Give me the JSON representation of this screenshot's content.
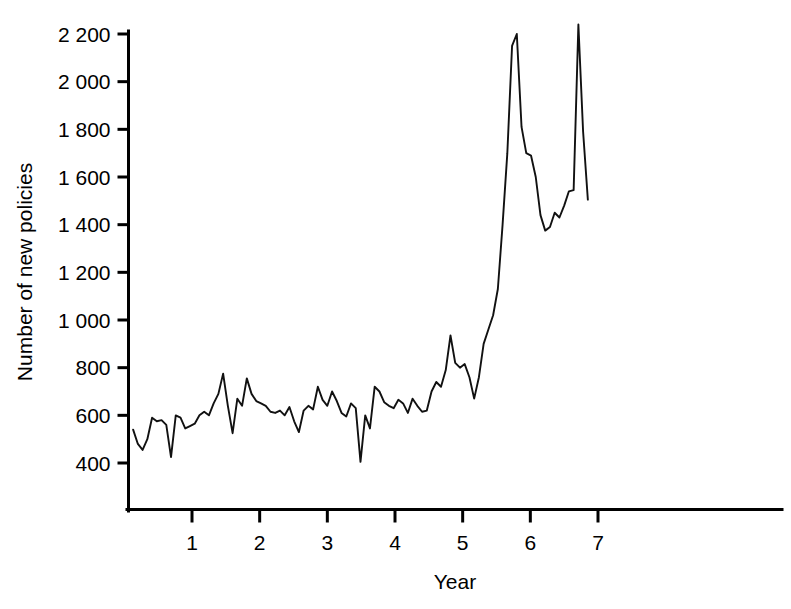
{
  "chart_data": {
    "type": "line",
    "title": "",
    "xlabel": "Year",
    "ylabel": "Number of new policies",
    "xlim": [
      0,
      7.15
    ],
    "ylim": [
      330,
      2300
    ],
    "grid": false,
    "legend": "none",
    "y_ticks": [
      400,
      600,
      800,
      1000,
      1200,
      1400,
      1600,
      1800,
      2000,
      2200
    ],
    "y_tick_labels": [
      "400",
      "600",
      "800",
      "1 000",
      "1 200",
      "1 400",
      "1 600",
      "1 800",
      "2 000",
      "2 200"
    ],
    "x_ticks": [
      1,
      2,
      3,
      4,
      5,
      6,
      7
    ],
    "x_tick_labels": [
      "1",
      "2",
      "3",
      "4",
      "5",
      "6",
      "7"
    ],
    "series": [
      {
        "name": "Number of new policies",
        "color": "#111111",
        "x": [
          0.13,
          0.2,
          0.27,
          0.34,
          0.41,
          0.48,
          0.55,
          0.62,
          0.69,
          0.76,
          0.83,
          0.9,
          0.97,
          1.04,
          1.11,
          1.18,
          1.25,
          1.32,
          1.39,
          1.46,
          1.53,
          1.6,
          1.67,
          1.74,
          1.81,
          1.88,
          1.95,
          2.02,
          2.09,
          2.16,
          2.23,
          2.3,
          2.37,
          2.44,
          2.51,
          2.58,
          2.65,
          2.72,
          2.79,
          2.86,
          2.93,
          3.0,
          3.07,
          3.14,
          3.21,
          3.28,
          3.35,
          3.42,
          3.49,
          3.56,
          3.63,
          3.7,
          3.77,
          3.84,
          3.91,
          3.98,
          4.05,
          4.12,
          4.19,
          4.26,
          4.33,
          4.4,
          4.47,
          4.54,
          4.61,
          4.68,
          4.75,
          4.82,
          4.89,
          4.96,
          5.03,
          5.1,
          5.17,
          5.24,
          5.31,
          5.38,
          5.45,
          5.52,
          5.59,
          5.66,
          5.73,
          5.8,
          5.87,
          5.94,
          6.01,
          6.08,
          6.15,
          6.22,
          6.29,
          6.36,
          6.43,
          6.5,
          6.57,
          6.64,
          6.71,
          6.78,
          6.85
        ],
        "y": [
          540,
          480,
          455,
          500,
          590,
          575,
          580,
          560,
          425,
          600,
          590,
          545,
          555,
          565,
          600,
          615,
          600,
          650,
          690,
          775,
          640,
          525,
          670,
          640,
          755,
          690,
          660,
          650,
          640,
          615,
          610,
          620,
          600,
          635,
          575,
          530,
          620,
          640,
          625,
          720,
          665,
          640,
          700,
          660,
          610,
          595,
          650,
          630,
          405,
          600,
          545,
          720,
          700,
          655,
          640,
          630,
          665,
          650,
          610,
          670,
          640,
          615,
          620,
          700,
          740,
          720,
          790,
          935,
          820,
          800,
          815,
          760,
          670,
          760,
          900,
          960,
          1020,
          1130,
          1400,
          1700,
          2150,
          2200,
          1810,
          1700,
          1690,
          1600,
          1440,
          1375,
          1390,
          1450,
          1430,
          1480,
          1540,
          1545,
          2240,
          1790,
          1505
        ]
      }
    ]
  },
  "axes": {
    "y_axis_name": "y-axis",
    "x_axis_name": "x-axis"
  }
}
